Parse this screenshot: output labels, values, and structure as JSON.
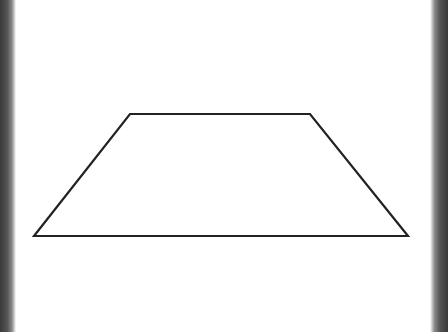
{
  "diagram": {
    "shape": "trapezoid",
    "stroke_color": "#222222",
    "fill_color": "#ffffff",
    "background_color": "#ffffff",
    "vertices": [
      {
        "name": "top-left",
        "x": 130,
        "y": 114
      },
      {
        "name": "top-right",
        "x": 310,
        "y": 114
      },
      {
        "name": "bottom-right",
        "x": 408,
        "y": 236
      },
      {
        "name": "bottom-left",
        "x": 34,
        "y": 236
      }
    ],
    "edge_texture_color": "#444444"
  }
}
